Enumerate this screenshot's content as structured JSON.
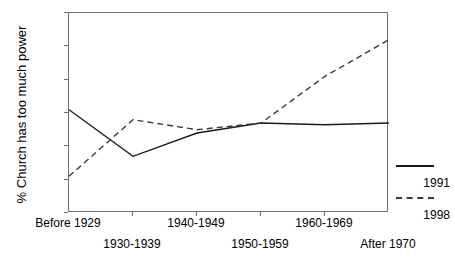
{
  "chart_data": {
    "type": "line",
    "title": "",
    "xlabel": "",
    "ylabel": "% Church has too much power",
    "categories": [
      "Before 1929",
      "1930-1939",
      "1940-1949",
      "1950-1959",
      "1960-1969",
      "After 1970"
    ],
    "series": [
      {
        "name": "1991",
        "style": "solid",
        "values": [
          51,
          37,
          44,
          47,
          46.5,
          47
        ]
      },
      {
        "name": "1998",
        "style": "dashed",
        "values": [
          31,
          48,
          45,
          47,
          61,
          72
        ]
      }
    ],
    "ylim": [
      20,
      80
    ],
    "ytick_labels": [
      "20%",
      "30%",
      "40%",
      "50%",
      "60%",
      "70%",
      "80%"
    ],
    "ytick_values": [
      20,
      30,
      40,
      50,
      60,
      70,
      80
    ],
    "grid": false,
    "legend_position": "right"
  },
  "axis": {
    "y_title": "% Church has too much power"
  },
  "legend": {
    "entries": [
      {
        "label": "1991",
        "style": "solid"
      },
      {
        "label": "1998",
        "style": "dashed"
      }
    ]
  },
  "colors": {
    "series_1991": "#1a1a1a",
    "series_1998": "#3a3a3a",
    "axis": "#6f6f6f",
    "background": "#ffffff"
  }
}
